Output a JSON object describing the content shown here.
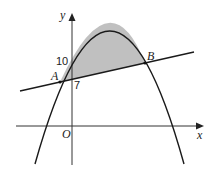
{
  "diagram": {
    "type": "coordinate-geometry",
    "axes": {
      "x_label": "x",
      "y_label": "y",
      "origin_label": "O"
    },
    "curve": {
      "kind": "parabola",
      "opens": "down",
      "y_intercept_label": "10"
    },
    "line": {
      "kind": "straight-line",
      "y_intercept_label": "7"
    },
    "points": [
      {
        "label": "A",
        "role": "left intersection of line and curve"
      },
      {
        "label": "B",
        "role": "right intersection of line and curve"
      }
    ],
    "shaded_region": {
      "fill": "#c0c0c0",
      "between": "curve and line, from A to B"
    },
    "colors": {
      "stroke": "#1a1a1a",
      "axis": "#333333",
      "shade": "#c0c0c0"
    }
  }
}
